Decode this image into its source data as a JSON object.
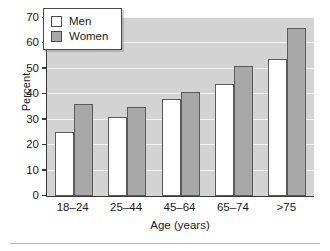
{
  "chart_data": {
    "type": "bar",
    "title": "",
    "subtitle": "",
    "xlabel": "Age (years)",
    "ylabel": "Percent",
    "categories": [
      "18–24",
      "25–44",
      "45–64",
      "65–74",
      ">75"
    ],
    "series": [
      {
        "name": "Men",
        "values": [
          25,
          31,
          38,
          44,
          54
        ],
        "color": "#ffffff"
      },
      {
        "name": "Women",
        "values": [
          36,
          35,
          41,
          51,
          66
        ],
        "color": "#a8a8a8"
      }
    ],
    "ylim": [
      0,
      70
    ],
    "ytick_labels": [
      "70",
      "60",
      "50",
      "40",
      "30",
      "20",
      "10",
      "0"
    ],
    "ytick_values": [
      70,
      60,
      50,
      40,
      30,
      20,
      10,
      0
    ],
    "ytick_step": 10,
    "grid": "horizontal",
    "grid_color": "#f2f2f2",
    "plot_background": "#d3d3d3",
    "axis_color": "#3a3a3a",
    "bar_border_color": "#5a5a5a",
    "legend_position": "top-left",
    "legend_entries": [
      "Men",
      "Women"
    ]
  },
  "legend": {
    "men_label": "Men",
    "women_label": "Women"
  },
  "axes": {
    "y_title": "Percent",
    "x_title": "Age (years)"
  }
}
